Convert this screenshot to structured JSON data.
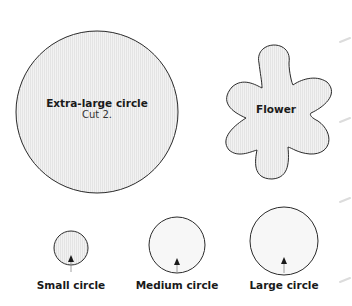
{
  "shapes": {
    "extra_large": {
      "title": "Extra-large circle",
      "note": "Cut 2."
    },
    "flower": {
      "title": "Flower"
    },
    "small": {
      "title": "Small circle"
    },
    "medium": {
      "title": "Medium circle"
    },
    "large": {
      "title": "Large circle"
    }
  },
  "colors": {
    "fill": "#ececec",
    "stroke": "#2a2a2a",
    "page": "#ffffff"
  }
}
